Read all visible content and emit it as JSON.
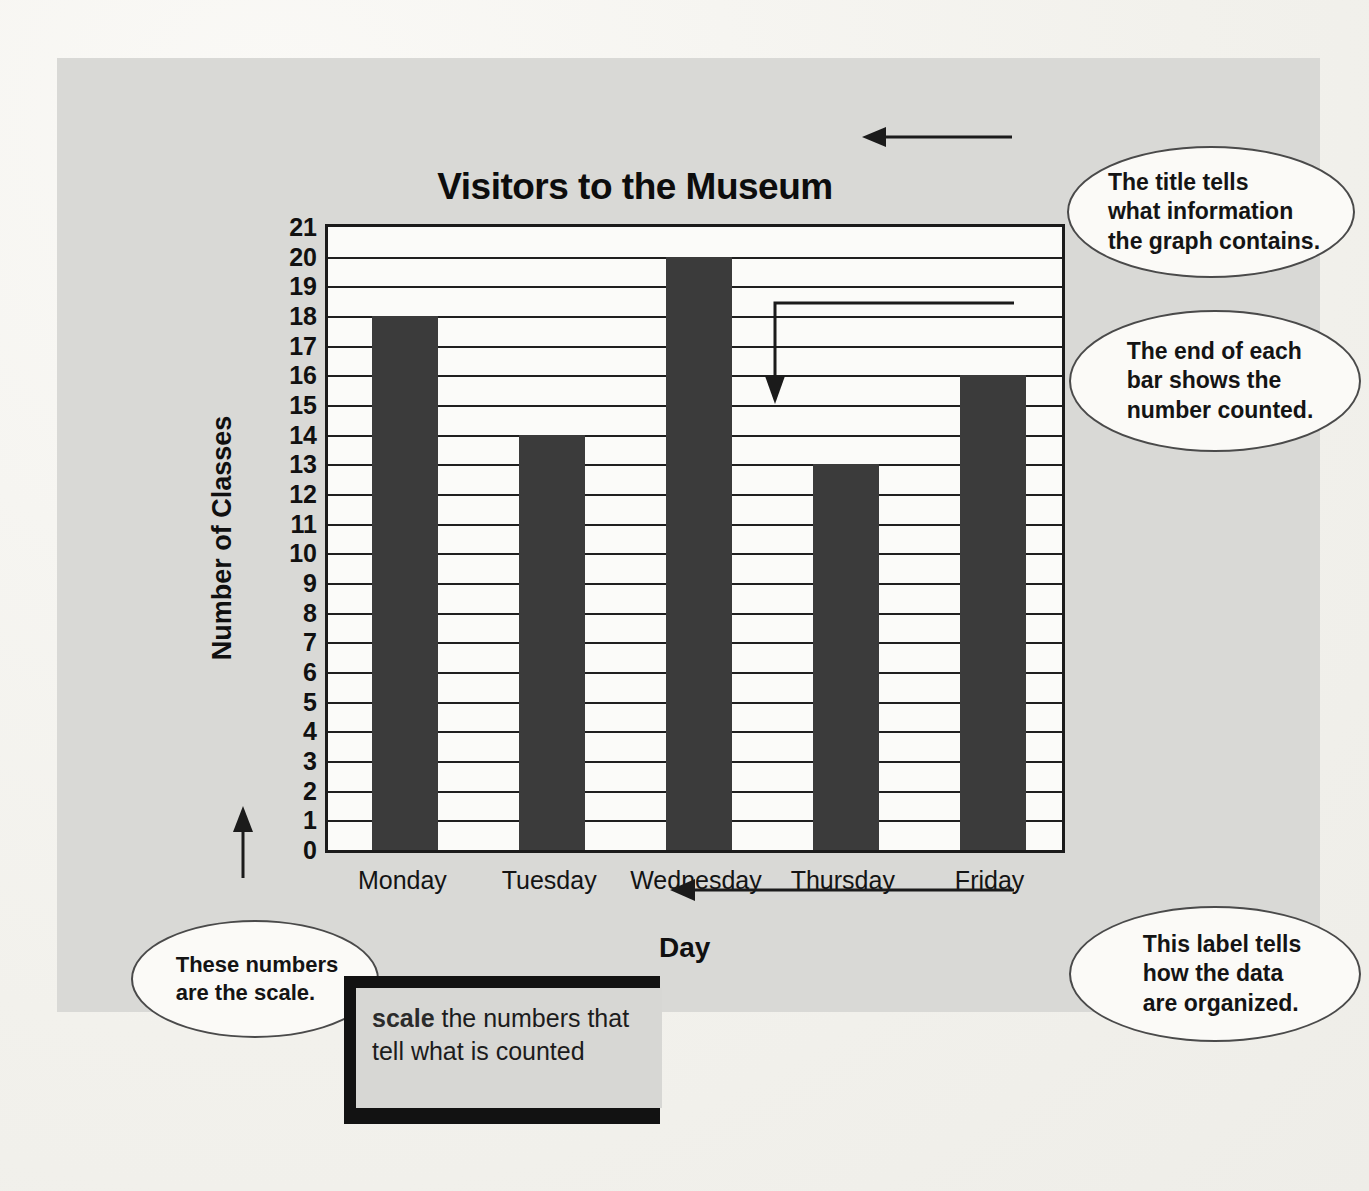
{
  "chart_data": {
    "type": "bar",
    "title": "Visitors to the Museum",
    "xlabel": "Day",
    "ylabel": "Number of Classes",
    "categories": [
      "Monday",
      "Tuesday",
      "Wednesday",
      "Thursday",
      "Friday"
    ],
    "values": [
      18,
      14,
      20,
      13,
      16
    ],
    "ylim": [
      0,
      21
    ],
    "ytick_labels": [
      "21",
      "20",
      "19",
      "18",
      "17",
      "16",
      "15",
      "14",
      "13",
      "12",
      "11",
      "10",
      "9",
      "8",
      "7",
      "6",
      "5",
      "4",
      "3",
      "2",
      "1",
      "0"
    ],
    "ytick_step": 1,
    "grid": true,
    "legend": null,
    "bar_color": "#3b3b3b",
    "plot_background": "#fbfbf9",
    "annotations": [
      "The title tells what information the graph contains.",
      "The end of each bar shows the number counted.",
      "This label tells how the data are organized.",
      "These numbers are the scale."
    ]
  },
  "panel": {
    "background": "#d9d9d6"
  },
  "callouts": {
    "title_note": "The title tells\nwhat information\nthe graph contains.",
    "bar_note": "The end of each\nbar shows the\nnumber counted.",
    "day_note": "This label tells\nhow the data\nare organized.",
    "scale_note_line1": "These numbers",
    "scale_note_line2_prefix": "are the ",
    "scale_note_line2_bold": "scale",
    "scale_note_line2_suffix": "."
  },
  "glossary": {
    "term": "scale",
    "definition": "the numbers that tell what is counted"
  }
}
